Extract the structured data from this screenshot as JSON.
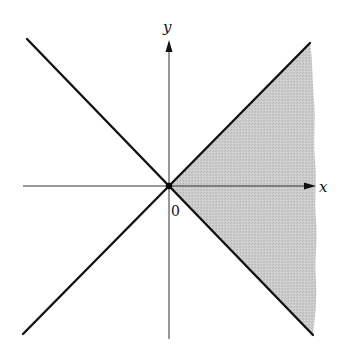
{
  "figure": {
    "labels": {
      "x_axis": "x",
      "y_axis": "y",
      "origin": "0"
    },
    "colors": {
      "line": "#111111",
      "axis": "#333333",
      "shade": "#c9c9c9",
      "background": "#ffffff"
    },
    "geometry": {
      "origin": [
        169,
        186
      ],
      "x_axis": {
        "from": [
          23,
          186
        ],
        "to": [
          316,
          186
        ]
      },
      "y_axis": {
        "from": [
          169,
          339
        ],
        "to": [
          169,
          40
        ]
      },
      "line_y_eq_x": {
        "from": [
          23,
          334
        ],
        "to": [
          310,
          43
        ]
      },
      "line_y_eq_neg_x": {
        "from": [
          27,
          39
        ],
        "to": [
          313,
          335
        ]
      },
      "shaded_region": "x >= |y|"
    }
  }
}
